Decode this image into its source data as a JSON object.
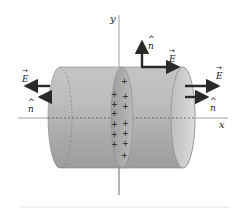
{
  "diagram": {
    "axes": {
      "x_label": "x",
      "y_label": "y"
    },
    "labels": {
      "E_left": "E",
      "n_left": "n",
      "E_top": "E",
      "n_top": "n",
      "E_right": "E",
      "n_right": "n"
    },
    "sheet_charges": [
      "+",
      "+",
      "+",
      "+",
      "+",
      "+",
      "+",
      "+",
      "+",
      "+",
      "+",
      "+",
      "+",
      "+"
    ],
    "colors": {
      "cylinder_fill": "#b8b8b8",
      "cylinder_end": "#d0d0d0",
      "sheet_fill": "#a9a9a9",
      "arrow": "#2a2a2a",
      "axis": "#777777"
    }
  }
}
